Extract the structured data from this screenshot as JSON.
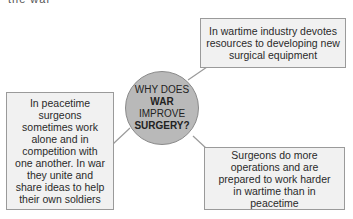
{
  "cropped_top_text": "the war",
  "center": {
    "line1": "WHY DOES",
    "line2": "WAR",
    "line3": "IMPROVE",
    "line4": "SURGERY?"
  },
  "boxes": {
    "top_right": "In wartime industry devotes resources to developing new surgical equipment",
    "left": "In peacetime surgeons sometimes work alone and in competition with one another. In war they unite and share ideas to help their own soldiers",
    "bottom_right": "Surgeons do more operations and are prepared to work harder in wartime than in peacetime"
  },
  "colors": {
    "circle_fill": "#b9b9b9",
    "box_fill": "#f1f1f1",
    "border": "#9a9a9a"
  }
}
